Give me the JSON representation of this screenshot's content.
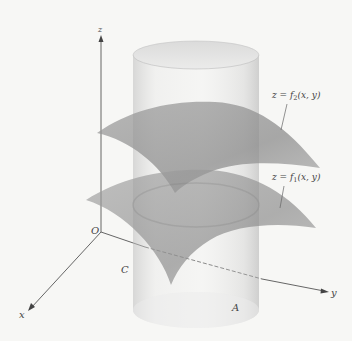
{
  "figure": {
    "axes": {
      "origin_label": "O",
      "x_label": "x",
      "y_label": "y",
      "z_label": "z"
    },
    "surfaces": [
      {
        "name": "upper",
        "label_prefix": "z = f",
        "subscript": "2",
        "label_suffix": "(x, y)"
      },
      {
        "name": "lower",
        "label_prefix": "z = f",
        "subscript": "1",
        "label_suffix": "(x, y)"
      }
    ],
    "region_labels": {
      "boundary_curve": "C",
      "base_region": "A"
    },
    "colors": {
      "background": "#f7f7f5",
      "axis": "#555555",
      "cylinder": "#c8c8c8",
      "surface": "#8a8a8a",
      "label": "#444444"
    }
  }
}
